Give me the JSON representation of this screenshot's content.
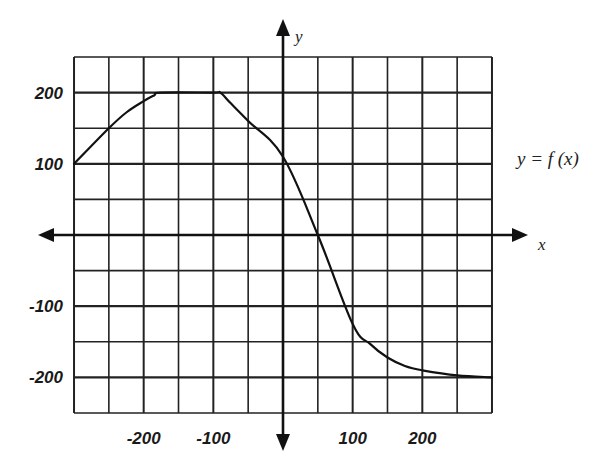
{
  "chart_data": {
    "type": "line",
    "title": "",
    "xlabel": "x",
    "ylabel": "y",
    "function_label": "y = f (x)",
    "xlim": [
      -300,
      300
    ],
    "ylim": [
      -250,
      250
    ],
    "grid": true,
    "grid_step_x": 50,
    "grid_step_y": 50,
    "x_ticks": [
      -200,
      -100,
      100,
      200
    ],
    "x_tick_labels": [
      "-200",
      "-100",
      "100",
      "200"
    ],
    "y_ticks": [
      200,
      100,
      -100,
      -200
    ],
    "y_tick_labels": [
      "200",
      "100",
      "-100",
      "-200"
    ],
    "legend": null,
    "series": [
      {
        "name": "y = f (x)",
        "x": [
          -300,
          -250,
          -225,
          -200,
          -185,
          -175,
          -100,
          -90,
          -75,
          -50,
          0,
          50,
          100,
          125,
          150,
          175,
          200,
          250,
          300
        ],
        "y": [
          100,
          150,
          172,
          188,
          196,
          200,
          200,
          200,
          185,
          160,
          110,
          0,
          -125,
          -153,
          -172,
          -184,
          -190,
          -197,
          -200
        ]
      }
    ]
  },
  "labels": {
    "x_axis": "x",
    "y_axis": "y",
    "function": "y = f (x)",
    "x_ticks": [
      "-200",
      "-100",
      "100",
      "200"
    ],
    "y_ticks": [
      "200",
      "100",
      "-100",
      "-200"
    ]
  }
}
